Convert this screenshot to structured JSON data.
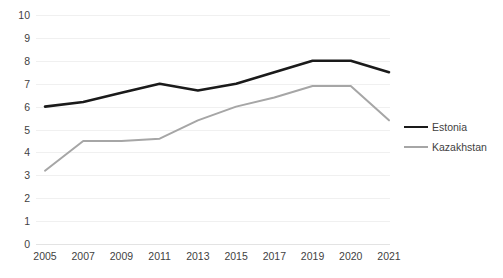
{
  "chart_data": {
    "type": "line",
    "title": "",
    "subtitle": "",
    "xlabel": "",
    "ylabel": "",
    "categories": [
      "2005",
      "2007",
      "2009",
      "2011",
      "2013",
      "2015",
      "2017",
      "2019",
      "2020",
      "2021"
    ],
    "series": [
      {
        "name": "Estonia",
        "color": "#1a1a1a",
        "line_width": 2.6,
        "values": [
          6.0,
          6.2,
          6.6,
          7.0,
          6.7,
          7.0,
          7.5,
          8.0,
          8.0,
          7.5
        ]
      },
      {
        "name": "Kazakhstan",
        "color": "#a6a6a6",
        "line_width": 2.0,
        "values": [
          3.2,
          4.5,
          4.5,
          4.6,
          5.4,
          6.0,
          6.4,
          6.9,
          6.9,
          5.4
        ]
      }
    ],
    "ylim": [
      0,
      10
    ],
    "yticks": [
      "0",
      "1",
      "2",
      "3",
      "4",
      "5",
      "6",
      "7",
      "8",
      "9",
      "10"
    ],
    "grid": true,
    "grid_color": "#f0f0f0",
    "legend_position": "right",
    "background": "#ffffff"
  },
  "legend": {
    "entries": [
      {
        "label": "Estonia"
      },
      {
        "label": "Kazakhstan"
      }
    ]
  }
}
